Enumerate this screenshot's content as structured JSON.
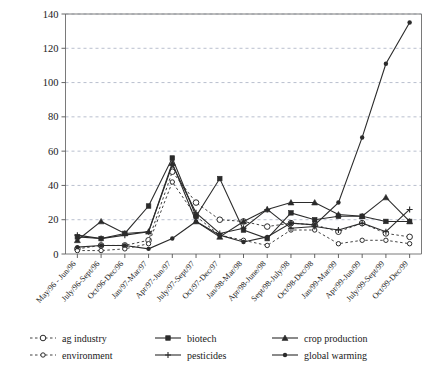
{
  "chart_data": {
    "type": "line",
    "title": "",
    "subtitle": "",
    "xlabel": "",
    "ylabel": "",
    "ylim": [
      0,
      140
    ],
    "ytick_step": 20,
    "yticks": [
      "0",
      "20",
      "40",
      "60",
      "80",
      "100",
      "120",
      "140"
    ],
    "grid": true,
    "legend_position": "bottom",
    "legend_columns": 3,
    "categories": [
      "May/96 - Jun/96",
      "July/96-Sept/96",
      "Oct/96-Dec/96",
      "Jan/97-Mar/97",
      "Apr/97-Jun/97",
      "July/97-Sept/97",
      "Oct/97-Dec/97",
      "Jan/98-Mar/98",
      "Apr/98-June/98",
      "Sept/98-July/98",
      "Oct/98-Dec/98",
      "Jan/99-Mar/99",
      "Apr/99-Jun/99",
      "July/99-Sept/99",
      "Oct/99-Dec/99"
    ],
    "series": [
      {
        "name": "ag industry",
        "style": "dashed",
        "marker": "open-circle",
        "values": [
          3,
          5,
          5,
          8,
          48,
          30,
          20,
          19,
          16,
          18,
          17,
          13,
          18,
          12,
          10
        ]
      },
      {
        "name": "environment",
        "style": "dashed",
        "marker": "open-circle-small",
        "values": [
          2,
          2,
          3,
          6,
          42,
          22,
          11,
          8,
          5,
          14,
          14,
          6,
          8,
          8,
          6
        ]
      },
      {
        "name": "biotech",
        "style": "solid",
        "marker": "square",
        "values": [
          10,
          9,
          12,
          28,
          56,
          22,
          44,
          14,
          9,
          24,
          20,
          22,
          22,
          19,
          19
        ]
      },
      {
        "name": "pesticides",
        "style": "solid",
        "marker": "plus",
        "values": [
          11,
          9,
          11,
          13,
          52,
          24,
          12,
          15,
          26,
          15,
          16,
          14,
          18,
          13,
          26
        ]
      },
      {
        "name": "crop production",
        "style": "solid",
        "marker": "triangle",
        "values": [
          8,
          19,
          12,
          13,
          53,
          19,
          10,
          19,
          26,
          30,
          30,
          23,
          22,
          33,
          19
        ]
      },
      {
        "name": "global warming",
        "style": "solid",
        "marker": "dot",
        "values": [
          4,
          5,
          5,
          3,
          9,
          19,
          11,
          7,
          10,
          18,
          17,
          30,
          68,
          111,
          135
        ]
      }
    ]
  },
  "legend": {
    "items": [
      {
        "label": "ag industry"
      },
      {
        "label": "biotech"
      },
      {
        "label": "crop production"
      },
      {
        "label": "environment"
      },
      {
        "label": "pesticides"
      },
      {
        "label": "global warming"
      }
    ]
  }
}
